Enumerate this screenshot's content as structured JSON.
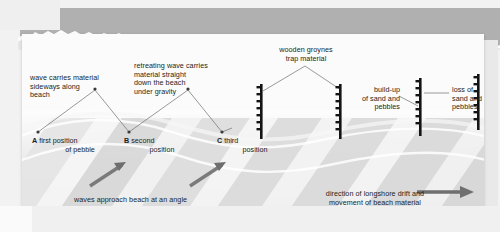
{
  "figure": {
    "colors": {
      "paper": "#fbfbfb",
      "band": "#b0b0b0",
      "sand_light": "#f4f4f4",
      "sand_mid": "#e2e2e2",
      "sand_dark": "#cfcfcf",
      "groyne": "#1a1a1a",
      "arrow": "#707070",
      "leader": "#6e6e6e",
      "text": "#231f20"
    }
  },
  "annotations": {
    "wave_carries": "wave carries material\nsideways along\nbeach",
    "retreating_wave": "retreating wave carries\nmaterial straight\ndown the beach\nunder gravity",
    "wooden_groynes": "wooden groynes\ntrap material",
    "build_up": "build-up\nof sand and\npebbles",
    "loss_of": "loss of\nsand and\npebbles",
    "waves_approach": "waves approach beach at an angle",
    "longshore_direction": "direction of longshore drift and\nmovement of beach material"
  },
  "positions": [
    {
      "key": "A",
      "label": "first position\nof pebble"
    },
    {
      "key": "B",
      "label": "second\nposition"
    },
    {
      "key": "C",
      "label": "third\nposition"
    }
  ],
  "groynes": [
    {
      "name": "groyne-1",
      "posts": 7
    },
    {
      "name": "groyne-2",
      "posts": 7
    },
    {
      "name": "groyne-3",
      "posts": 7
    },
    {
      "name": "groyne-4",
      "posts": 7
    }
  ],
  "arrows": [
    {
      "name": "wave-arrow-1"
    },
    {
      "name": "wave-arrow-2"
    },
    {
      "name": "longshore-drift-arrow"
    }
  ]
}
